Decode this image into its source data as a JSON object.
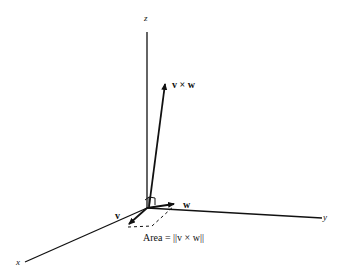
{
  "diagram": {
    "axes": {
      "x": {
        "label": "x"
      },
      "y": {
        "label": "y"
      },
      "z": {
        "label": "z"
      }
    },
    "vectors": {
      "v": {
        "label": "v"
      },
      "w": {
        "label": "w"
      },
      "cross": {
        "label": "v × w"
      }
    },
    "area_label": "Area = ||v × w||",
    "colors": {
      "line": "#111111",
      "background": "#ffffff"
    }
  }
}
